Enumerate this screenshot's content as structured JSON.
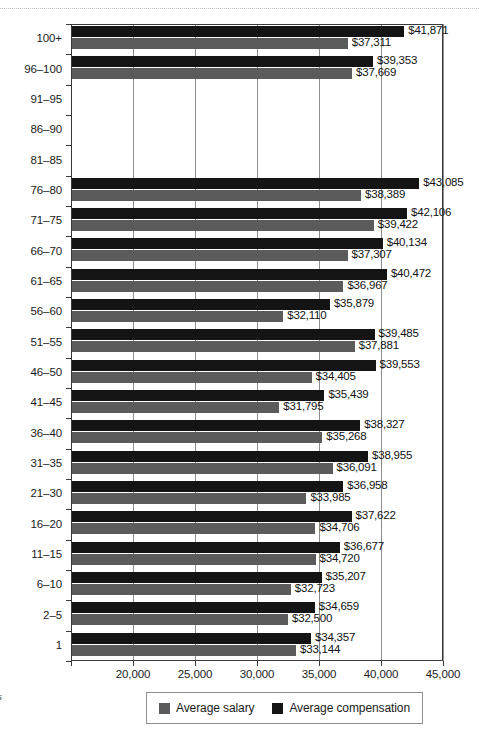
{
  "figure": {
    "top_rule": "dotted-rule",
    "margin_note": "rs"
  },
  "legend": {
    "position": "bottom-center",
    "items": [
      {
        "label": "Average salary",
        "color": "#5b5b5b",
        "swatch": "salary-swatch"
      },
      {
        "label": "Average compensation",
        "color": "#141414",
        "swatch": "compensation-swatch"
      }
    ]
  },
  "axis": {
    "x_ticks": [
      "20,000",
      "25,000",
      "30,000",
      "35,000",
      "40,000",
      "45,000"
    ],
    "x_tick_values": [
      20000,
      25000,
      30000,
      35000,
      40000,
      45000
    ],
    "x_min": 15000,
    "x_max": 45000
  },
  "chart_data": {
    "type": "bar",
    "orientation": "horizontal",
    "title": "",
    "subtitle": "",
    "xlabel": "",
    "ylabel": "",
    "xlim": [
      15000,
      45000
    ],
    "grid": true,
    "legend_position": "bottom",
    "categories": [
      "100+",
      "96–100",
      "91–95",
      "86–90",
      "81–85",
      "76–80",
      "71–75",
      "66–70",
      "61–65",
      "56–60",
      "51–55",
      "46–50",
      "41–45",
      "36–40",
      "31–35",
      "21–30",
      "16–20",
      "11–15",
      "6–10",
      "2–5",
      "1"
    ],
    "series": [
      {
        "name": "Average compensation",
        "color": "#141414",
        "values": [
          41871,
          39353,
          null,
          null,
          null,
          43085,
          42106,
          40134,
          40472,
          35879,
          39485,
          39553,
          35439,
          38327,
          38955,
          36958,
          37622,
          36677,
          35207,
          34659,
          34357
        ],
        "labels": [
          "$41,871",
          "$39,353",
          "",
          "",
          "",
          "$43,085",
          "$42,106",
          "$40,134",
          "$40,472",
          "$35,879",
          "$39,485",
          "$39,553",
          "$35,439",
          "$38,327",
          "$38,955",
          "$36,958",
          "$37,622",
          "$36,677",
          "$35,207",
          "$34,659",
          "$34,357"
        ]
      },
      {
        "name": "Average salary",
        "color": "#5b5b5b",
        "values": [
          37311,
          37669,
          null,
          null,
          null,
          38389,
          39422,
          37307,
          36967,
          32110,
          37881,
          34405,
          31795,
          35268,
          36091,
          33985,
          34706,
          34720,
          32723,
          32500,
          33144
        ],
        "labels": [
          "$37,311",
          "$37,669",
          "",
          "",
          "",
          "$38,389",
          "$39,422",
          "$37,307",
          "$36,967",
          "$32,110",
          "$37,881",
          "$34,405",
          "$31,795",
          "$35,268",
          "$36,091",
          "$33,985",
          "$34,706",
          "$34,720",
          "$32,723",
          "$32,500",
          "$33,144"
        ]
      }
    ]
  }
}
